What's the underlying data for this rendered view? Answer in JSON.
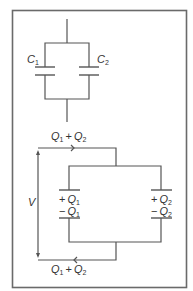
{
  "diagram": {
    "type": "circuit",
    "top_circuit": {
      "description": "Two capacitors in parallel",
      "capacitors": [
        {
          "symbol": "C",
          "subscript": "1"
        },
        {
          "symbol": "C",
          "subscript": "2"
        }
      ]
    },
    "bottom_circuit": {
      "top_current_label": {
        "a": "Q",
        "a_sub": "1",
        "op": "+",
        "b": "Q",
        "b_sub": "2"
      },
      "bottom_current_label": {
        "a": "Q",
        "a_sub": "1",
        "op": "+",
        "b": "Q",
        "b_sub": "2"
      },
      "voltage_label": "V",
      "left_capacitor": {
        "plus_sign": "+",
        "plus_symbol": "Q",
        "plus_sub": "1",
        "minus_sign": "−",
        "minus_symbol": "Q",
        "minus_sub": "1"
      },
      "right_capacitor": {
        "plus_sign": "+",
        "plus_symbol": "Q",
        "plus_sub": "2",
        "minus_sign": "−",
        "minus_symbol": "Q",
        "minus_sub": "2"
      }
    },
    "colors": {
      "line": "#555555",
      "frame": "#6a6a6a",
      "text": "#333333",
      "background": "#ffffff"
    }
  }
}
